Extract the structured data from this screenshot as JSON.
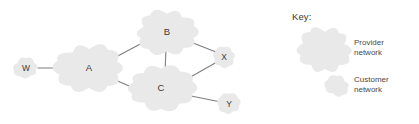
{
  "figure": {
    "type": "network-topology-diagram",
    "background_color": "#ffffff",
    "cloud_fill_color": "#e9e9e9",
    "line_color": "#7e7e7e",
    "text_color": "#3a3a3a"
  },
  "nodes": [
    {
      "id": "W",
      "label": "W",
      "kind": "customer",
      "cx": 26,
      "cy": 68,
      "rx": 11,
      "ry": 9
    },
    {
      "id": "A",
      "label": "A",
      "kind": "provider",
      "cx": 89,
      "cy": 68,
      "rx": 30,
      "ry": 21
    },
    {
      "id": "B",
      "label": "B",
      "kind": "provider",
      "cx": 167,
      "cy": 32,
      "rx": 27,
      "ry": 19
    },
    {
      "id": "C",
      "label": "C",
      "kind": "provider",
      "cx": 161,
      "cy": 88,
      "rx": 30,
      "ry": 19
    },
    {
      "id": "X",
      "label": "X",
      "kind": "customer",
      "cx": 224,
      "cy": 57,
      "rx": 10.5,
      "ry": 9
    },
    {
      "id": "Y",
      "label": "Y",
      "kind": "customer",
      "cx": 229,
      "cy": 104,
      "rx": 10.5,
      "ry": 9
    }
  ],
  "edges": [
    {
      "from": "W",
      "to": "A",
      "x1": 38,
      "y1": 68,
      "x2": 66,
      "y2": 68
    },
    {
      "from": "A",
      "to": "B",
      "x1": 114,
      "y1": 58,
      "x2": 146,
      "y2": 41
    },
    {
      "from": "A",
      "to": "C",
      "x1": 113,
      "y1": 79,
      "x2": 136,
      "y2": 89
    },
    {
      "from": "B",
      "to": "C",
      "x1": 166,
      "y1": 49,
      "x2": 165,
      "y2": 73
    },
    {
      "from": "B",
      "to": "X",
      "x1": 188,
      "y1": 41,
      "x2": 216,
      "y2": 52
    },
    {
      "from": "C",
      "to": "X",
      "x1": 187,
      "y1": 79,
      "x2": 217,
      "y2": 62
    },
    {
      "from": "C",
      "to": "Y",
      "x1": 186,
      "y1": 95,
      "x2": 221,
      "y2": 102
    }
  ],
  "key": {
    "heading": "Key:",
    "entries": [
      {
        "id": "provider",
        "label_line1": "Provider",
        "label_line2": "network",
        "swatch_kind": "provider",
        "cx": 325,
        "cy": 49,
        "rx": 23,
        "ry": 19
      },
      {
        "id": "customer",
        "label_line1": "Customer",
        "label_line2": "network",
        "swatch_kind": "customer",
        "cx": 337,
        "cy": 86,
        "rx": 10.5,
        "ry": 9
      }
    ]
  }
}
